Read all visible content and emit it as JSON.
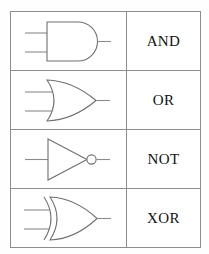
{
  "page": {
    "background_color": "#fefefe",
    "table_border_color": "#8d8d90",
    "symbol_stroke_color": "#6f6f74",
    "wire_stroke_color": "#8a8a8f",
    "label_text_color": "#111111"
  },
  "table": {
    "rows": [
      {
        "symbol_name": "and-gate-symbol",
        "label": "AND",
        "inputs": 2,
        "outputs": 1,
        "bubble": false
      },
      {
        "symbol_name": "or-gate-symbol",
        "label": "OR",
        "inputs": 2,
        "outputs": 1,
        "bubble": false
      },
      {
        "symbol_name": "not-gate-symbol",
        "label": "NOT",
        "inputs": 1,
        "outputs": 1,
        "bubble": true
      },
      {
        "symbol_name": "xor-gate-symbol",
        "label": "XOR",
        "inputs": 2,
        "outputs": 1,
        "bubble": false
      }
    ]
  }
}
